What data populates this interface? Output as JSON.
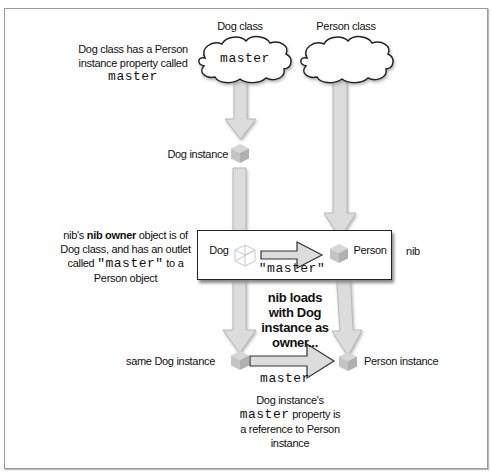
{
  "diagram": {
    "columns": {
      "dog_class": "Dog class",
      "person_class": "Person class"
    },
    "clouds": {
      "dog_cloud_text": "master",
      "person_cloud_text": ""
    },
    "annotations": {
      "class_note_line1": "Dog class has a Person",
      "class_note_line2": "instance property called",
      "class_note_code": "master",
      "dog_instance": "Dog instance",
      "nib_note_pre": "nib's ",
      "nib_note_bold": "nib owner",
      "nib_note_post": " object is of",
      "nib_note_line2": "Dog class, and has an outlet",
      "nib_note_line3_pre": "called ",
      "nib_note_line3_code": "\"master\"",
      "nib_note_line3_post": " to a",
      "nib_note_line4": "Person object",
      "nib_label": "nib",
      "loads_line1": "nib loads",
      "loads_line2": "with Dog",
      "loads_line3": "instance as",
      "loads_line4": "owner...",
      "same_dog_instance": "same Dog instance",
      "person_instance": "Person instance",
      "bottom_arrow_label": "master",
      "result_line1": "Dog instance's",
      "result_line2_code": "master",
      "result_line2_post": " property is",
      "result_line3": "a reference to Person",
      "result_line4": "instance"
    },
    "nib_box": {
      "dog_label": "Dog",
      "person_label": "Person",
      "outlet_label": "\"master\""
    }
  }
}
